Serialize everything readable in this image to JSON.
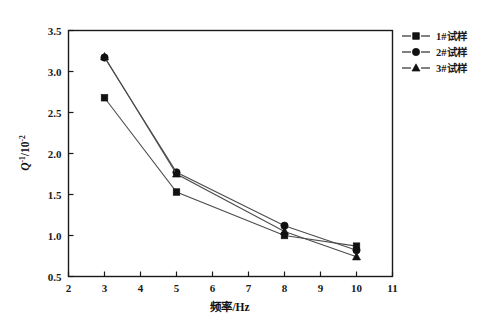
{
  "chart_data": {
    "type": "line",
    "title": "",
    "xlabel": "频率/Hz",
    "ylabel": "Q-1/10-2",
    "ylabel_parts": {
      "base": "Q",
      "base_sup": "-1",
      "divider": "/10",
      "divider_sup": "-2"
    },
    "x": [
      3,
      5,
      8,
      10
    ],
    "xlim": [
      2,
      11
    ],
    "ylim": [
      0.5,
      3.5
    ],
    "xticks": [
      2,
      3,
      4,
      5,
      6,
      7,
      8,
      9,
      10,
      11
    ],
    "xtick_labels": [
      "2",
      "3",
      "4",
      "5",
      "6",
      "7",
      "8",
      "9",
      "10",
      "11"
    ],
    "yticks": [
      0.5,
      1.0,
      1.5,
      2.0,
      2.5,
      3.0,
      3.5
    ],
    "ytick_labels": [
      "0.5",
      "1.0",
      "1.5",
      "2.0",
      "2.5",
      "3.0",
      "3.5"
    ],
    "grid": false,
    "legend_position": "top-right-outside",
    "series": [
      {
        "name": "1#试样",
        "marker": "square",
        "values": [
          2.68,
          1.53,
          1.0,
          0.87
        ]
      },
      {
        "name": "2#试样",
        "marker": "circle",
        "values": [
          3.17,
          1.77,
          1.12,
          0.82
        ]
      },
      {
        "name": "3#试样",
        "marker": "triangle",
        "values": [
          3.18,
          1.75,
          1.05,
          0.74
        ]
      }
    ]
  },
  "legend": {
    "items": [
      {
        "label": "1#试样",
        "marker": "square"
      },
      {
        "label": "2#试样",
        "marker": "circle"
      },
      {
        "label": "3#试样",
        "marker": "triangle"
      }
    ]
  },
  "colors": {
    "axis": "#1a1a1a",
    "line": "#4d4d4d",
    "marker": "#111111",
    "background": "#ffffff"
  }
}
